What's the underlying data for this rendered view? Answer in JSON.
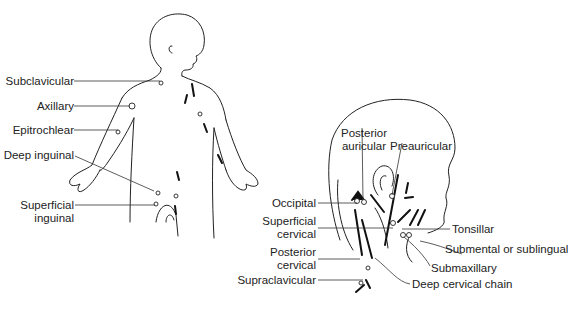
{
  "figure": {
    "body_view": {
      "labels": {
        "subclavicular": "Subclavicular",
        "axillary": "Axillary",
        "epitrochlear": "Epitrochlear",
        "deep_inguinal": "Deep inguinal",
        "superficial_inguinal_1": "Superficial",
        "superficial_inguinal_2": "inguinal"
      }
    },
    "head_view": {
      "labels": {
        "posterior_auricular_1": "Posterior",
        "posterior_auricular_2": "auricular",
        "preauricular": "Preauricular",
        "occipital": "Occipital",
        "superficial_cervical_1": "Superficial",
        "superficial_cervical_2": "cervical",
        "posterior_cervical_1": "Posterior",
        "posterior_cervical_2": "cervical",
        "supraclavicular": "Supraclavicular",
        "tonsillar": "Tonsillar",
        "submental": "Submental or sublingual",
        "submaxillary": "Submaxillary",
        "deep_cervical_chain": "Deep cervical chain"
      }
    }
  }
}
